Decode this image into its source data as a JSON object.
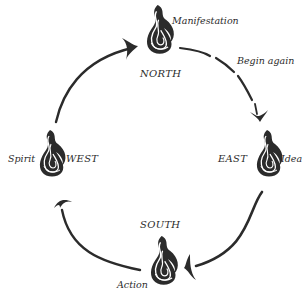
{
  "diagram": {
    "type": "cycle",
    "ink_color": "#2b2b2b",
    "nodes": [
      {
        "id": "north",
        "direction": "NORTH",
        "phase": "Manifestation",
        "icon": "flame-icon"
      },
      {
        "id": "east",
        "direction": "EAST",
        "phase": "Idea",
        "icon": "flame-icon"
      },
      {
        "id": "south",
        "direction": "SOUTH",
        "phase": "Action",
        "icon": "flame-icon"
      },
      {
        "id": "west",
        "direction": "WEST",
        "phase": "Spirit",
        "icon": "flame-icon"
      }
    ],
    "annotations": {
      "north_to_east": "Begin again"
    },
    "edges": [
      {
        "from": "north",
        "to": "east",
        "label": "Begin again"
      },
      {
        "from": "east",
        "to": "south"
      },
      {
        "from": "south",
        "to": "west"
      },
      {
        "from": "west",
        "to": "north"
      }
    ]
  }
}
